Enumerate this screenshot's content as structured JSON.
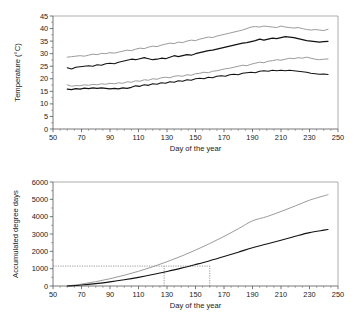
{
  "figure": {
    "background": "#ffffff",
    "colors": {
      "black_series": "#121212",
      "gray_series": "#9b9b9b",
      "axis": "#555555",
      "frame": "#9a9a9a",
      "refline": "#6e6e6e"
    }
  },
  "chart_data": [
    {
      "id": "temperature-panel",
      "type": "line",
      "title": "",
      "xlabel": "Day of the year",
      "ylabel": "Temperature (°C)",
      "xlim": [
        50,
        250
      ],
      "ylim": [
        0,
        45
      ],
      "xticks": [
        50,
        70,
        90,
        110,
        130,
        150,
        170,
        190,
        210,
        230,
        250
      ],
      "yticks": [
        0,
        5,
        10,
        15,
        20,
        25,
        30,
        35,
        40,
        45
      ],
      "xtick_labels": [
        "50",
        "70",
        "90",
        "110",
        "130",
        "150",
        "170",
        "190",
        "210",
        "230",
        "250"
      ],
      "ytick_labels": [
        "0",
        "5",
        "10",
        "15",
        "20",
        "25",
        "30",
        "35",
        "40",
        "45"
      ],
      "x_minor_step": 5,
      "grid": false,
      "legend": "none",
      "x": [
        60,
        63,
        66,
        69,
        72,
        75,
        78,
        81,
        84,
        87,
        90,
        93,
        96,
        99,
        102,
        105,
        108,
        111,
        114,
        117,
        120,
        123,
        126,
        129,
        132,
        135,
        138,
        141,
        144,
        147,
        150,
        153,
        156,
        159,
        162,
        165,
        168,
        171,
        174,
        177,
        180,
        183,
        186,
        189,
        192,
        195,
        198,
        201,
        204,
        207,
        210,
        213,
        216,
        219,
        222,
        225,
        228,
        231,
        234,
        237,
        240,
        243
      ],
      "series": [
        {
          "name": "gray-upper-maximum-temperature",
          "color": "#9b9b9b",
          "values": [
            28.6,
            28.8,
            29.0,
            29.2,
            29.0,
            29.4,
            29.8,
            29.6,
            30.1,
            30.0,
            30.4,
            30.2,
            30.6,
            31.0,
            31.4,
            31.2,
            31.8,
            32.2,
            32.0,
            32.6,
            33.0,
            32.8,
            33.4,
            33.8,
            34.2,
            34.0,
            34.6,
            34.4,
            35.0,
            35.4,
            35.2,
            35.8,
            36.2,
            36.6,
            36.4,
            37.0,
            37.4,
            37.8,
            38.2,
            38.6,
            39.0,
            39.4,
            40.0,
            40.6,
            40.8,
            40.6,
            41.0,
            40.8,
            40.6,
            40.4,
            41.0,
            40.6,
            40.4,
            40.2,
            40.4,
            40.0,
            39.6,
            39.4,
            39.6,
            39.4,
            39.2,
            39.7
          ]
        },
        {
          "name": "black-upper-maximum-temperature",
          "color": "#121212",
          "values": [
            24.4,
            23.9,
            24.6,
            24.8,
            25.0,
            25.2,
            25.0,
            25.6,
            25.4,
            26.0,
            26.2,
            26.0,
            26.6,
            27.0,
            27.4,
            27.8,
            27.6,
            28.0,
            28.4,
            28.0,
            27.6,
            27.8,
            28.2,
            28.0,
            28.6,
            29.2,
            28.8,
            29.2,
            29.6,
            29.4,
            30.0,
            30.4,
            30.8,
            31.2,
            31.4,
            31.8,
            32.2,
            32.6,
            33.0,
            33.4,
            33.8,
            34.2,
            34.4,
            34.8,
            35.2,
            35.8,
            35.4,
            35.8,
            36.2,
            36.0,
            36.4,
            36.8,
            36.6,
            36.4,
            36.0,
            35.6,
            35.2,
            35.0,
            34.8,
            34.6,
            34.8,
            34.9
          ]
        },
        {
          "name": "gray-lower-minimum-temperature",
          "color": "#9b9b9b",
          "values": [
            17.6,
            17.0,
            17.3,
            17.2,
            17.6,
            17.4,
            17.8,
            17.6,
            18.0,
            17.8,
            18.2,
            18.0,
            18.4,
            18.2,
            18.8,
            18.6,
            19.2,
            19.0,
            19.6,
            19.4,
            20.0,
            19.8,
            20.4,
            20.6,
            20.4,
            21.0,
            21.2,
            21.0,
            21.6,
            21.4,
            22.0,
            22.2,
            22.6,
            22.4,
            23.0,
            23.2,
            23.6,
            24.0,
            24.2,
            24.6,
            25.0,
            25.4,
            25.2,
            25.8,
            26.2,
            26.6,
            26.4,
            27.0,
            27.2,
            27.6,
            27.4,
            27.8,
            28.2,
            28.0,
            28.4,
            28.2,
            28.6,
            28.2,
            27.8,
            27.6,
            27.8,
            27.9
          ]
        },
        {
          "name": "black-lower-minimum-temperature",
          "color": "#121212",
          "values": [
            15.9,
            15.7,
            16.1,
            15.9,
            16.3,
            16.1,
            16.4,
            16.2,
            16.4,
            16.2,
            16.0,
            16.2,
            16.0,
            16.4,
            16.2,
            16.6,
            17.2,
            17.0,
            17.6,
            17.4,
            18.0,
            17.8,
            18.4,
            18.2,
            18.8,
            18.6,
            19.2,
            19.0,
            19.6,
            19.4,
            20.0,
            20.2,
            20.0,
            20.6,
            20.4,
            21.0,
            21.2,
            21.0,
            21.6,
            21.8,
            21.6,
            22.2,
            22.4,
            22.6,
            22.4,
            23.0,
            23.2,
            23.0,
            23.4,
            23.2,
            23.4,
            23.2,
            23.4,
            23.2,
            23.0,
            22.8,
            22.6,
            22.2,
            22.0,
            21.8,
            21.9,
            21.7
          ]
        }
      ]
    },
    {
      "id": "accumulated-degree-days-panel",
      "type": "line",
      "title": "",
      "xlabel": "Day of the year",
      "ylabel": "Accumulated degree days",
      "xlim": [
        50,
        250
      ],
      "ylim": [
        0,
        6000
      ],
      "xticks": [
        50,
        70,
        90,
        110,
        130,
        150,
        170,
        190,
        210,
        230,
        250
      ],
      "yticks": [
        0,
        1000,
        2000,
        3000,
        4000,
        5000,
        6000
      ],
      "xtick_labels": [
        "50",
        "70",
        "90",
        "110",
        "130",
        "150",
        "170",
        "190",
        "210",
        "230",
        "250"
      ],
      "ytick_labels": [
        "0",
        "1000",
        "2000",
        "3000",
        "4000",
        "5000",
        "6000"
      ],
      "x_minor_step": 5,
      "grid": false,
      "legend": "none",
      "x": [
        60,
        70,
        80,
        90,
        100,
        110,
        120,
        130,
        140,
        150,
        160,
        170,
        180,
        190,
        200,
        210,
        220,
        230,
        240,
        243
      ],
      "series": [
        {
          "name": "gray-accumulated-degree-days",
          "color": "#9b9b9b",
          "values": [
            0,
            110,
            250,
            420,
            620,
            850,
            1110,
            1400,
            1720,
            2070,
            2450,
            2860,
            3300,
            3760,
            4000,
            4300,
            4620,
            4950,
            5200,
            5270
          ]
        },
        {
          "name": "black-accumulated-degree-days",
          "color": "#121212",
          "values": [
            0,
            60,
            140,
            240,
            360,
            500,
            660,
            840,
            1030,
            1240,
            1460,
            1700,
            1950,
            2210,
            2420,
            2640,
            2870,
            3080,
            3220,
            3260
          ]
        }
      ],
      "annotations": [
        {
          "name": "threshold-horizontal-refline",
          "type": "hline",
          "y": 1150,
          "x_from": 50,
          "x_to": 160
        },
        {
          "name": "gray-crossing-vertical-refline",
          "type": "vline",
          "x": 128,
          "y_from": 0,
          "y_to": 1150
        },
        {
          "name": "black-crossing-vertical-refline",
          "type": "vline",
          "x": 160,
          "y_from": 0,
          "y_to": 1150
        }
      ]
    }
  ]
}
